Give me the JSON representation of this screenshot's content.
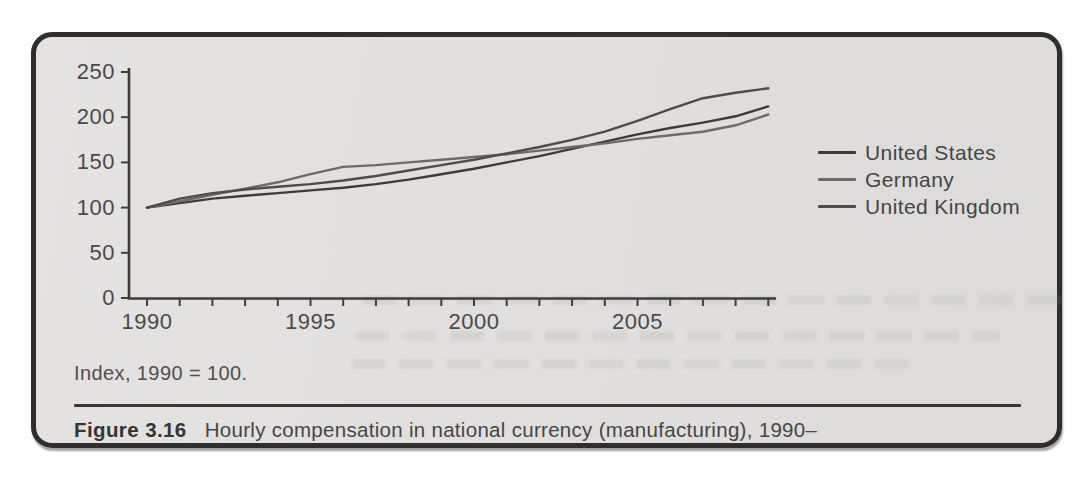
{
  "figure": {
    "note": "Index, 1990 = 100.",
    "caption_label": "Figure 3.16",
    "caption_text": "Hourly compensation in national currency (manufacturing), 1990–"
  },
  "chart_data": {
    "type": "line",
    "title": "",
    "xlabel": "",
    "ylabel": "",
    "x": [
      1990,
      1991,
      1992,
      1993,
      1994,
      1995,
      1996,
      1997,
      1998,
      1999,
      2000,
      2001,
      2002,
      2003,
      2004,
      2005,
      2006,
      2007,
      2008,
      2009
    ],
    "series": [
      {
        "name": "United States",
        "color": "#3c3c3c",
        "values": [
          100,
          105,
          110,
          113,
          116,
          119,
          122,
          126,
          131,
          137,
          143,
          150,
          157,
          165,
          173,
          181,
          188,
          194,
          201,
          212
        ]
      },
      {
        "name": "Germany",
        "color": "#6b6b6b",
        "values": [
          100,
          107,
          114,
          121,
          128,
          137,
          145,
          147,
          150,
          153,
          156,
          159,
          163,
          167,
          171,
          176,
          180,
          184,
          191,
          203
        ]
      },
      {
        "name": "United Kingdom",
        "color": "#4d4d4d",
        "values": [
          100,
          110,
          116,
          120,
          123,
          126,
          130,
          135,
          141,
          147,
          153,
          160,
          167,
          175,
          184,
          196,
          209,
          221,
          227,
          232
        ]
      }
    ],
    "ylim": [
      0,
      250
    ],
    "yticks": [
      0,
      50,
      100,
      150,
      200,
      250
    ],
    "xticks_labeled": [
      1990,
      1995,
      2000,
      2005
    ],
    "grid": false,
    "legend_position": "right",
    "axis_color": "#3e3e3e",
    "tick_label_color": "#4a4a4a"
  }
}
